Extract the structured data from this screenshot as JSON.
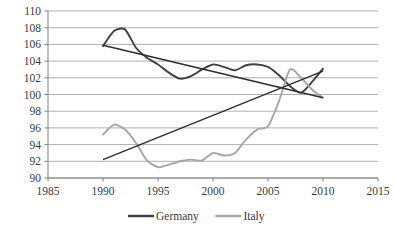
{
  "chart_data": {
    "type": "line",
    "title": "",
    "subtitle": "",
    "xlabel": "",
    "ylabel": "",
    "xlim": [
      1985,
      2015
    ],
    "ylim": [
      90,
      110
    ],
    "x_ticks": [
      1985,
      1990,
      1995,
      2000,
      2005,
      2010,
      2015
    ],
    "y_ticks": [
      90,
      92,
      94,
      96,
      98,
      100,
      102,
      104,
      106,
      108,
      110
    ],
    "grid": "horizontal",
    "legend_position": "bottom",
    "colors": {
      "germany": "#404040",
      "italy": "#a6a6a6",
      "gridline": "#b0b0b0",
      "axis": "#808080",
      "tick_text": "#3a3a3a"
    },
    "series": [
      {
        "name": "Germany",
        "color": "#404040",
        "x": [
          1990,
          1991,
          1992,
          1993,
          1994,
          1995,
          1996,
          1997,
          1998,
          1999,
          2000,
          2001,
          2002,
          2003,
          2004,
          2005,
          2006,
          2007,
          2008,
          2009,
          2010
        ],
        "values": [
          105.8,
          107.6,
          107.8,
          105.6,
          104.4,
          103.6,
          102.6,
          101.9,
          102.2,
          103.0,
          103.6,
          103.3,
          102.9,
          103.5,
          103.6,
          103.3,
          102.3,
          101.0,
          100.2,
          101.5,
          103.1
        ],
        "trendline": {
          "x": [
            1990,
            2010
          ],
          "values": [
            105.9,
            99.6
          ]
        }
      },
      {
        "name": "Italy",
        "color": "#a6a6a6",
        "x": [
          1990,
          1991,
          1992,
          1993,
          1994,
          1995,
          1996,
          1997,
          1998,
          1999,
          2000,
          2001,
          2002,
          2003,
          2004,
          2005,
          2006,
          2007,
          2008,
          2009,
          2010
        ],
        "values": [
          95.2,
          96.4,
          95.8,
          94.2,
          92.1,
          91.3,
          91.6,
          92.0,
          92.2,
          92.1,
          93.0,
          92.7,
          93.0,
          94.6,
          95.8,
          96.2,
          99.2,
          103.0,
          102.0,
          100.6,
          99.6
        ],
        "trendline": {
          "x": [
            1990,
            2010
          ],
          "values": [
            92.2,
            102.8
          ]
        }
      }
    ],
    "legend": [
      {
        "label": "Germany",
        "color": "#404040"
      },
      {
        "label": "Italy",
        "color": "#a6a6a6"
      }
    ]
  }
}
